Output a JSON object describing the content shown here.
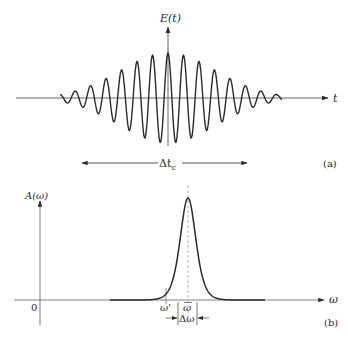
{
  "figure": {
    "panel_a": {
      "tag": "(a)",
      "y_label": "E(t)",
      "x_label": "t",
      "width_label_main": "Δt",
      "width_label_sub": "c"
    },
    "panel_b": {
      "tag": "(b)",
      "y_label": "A(ω)",
      "x_label": "ω",
      "origin_label": "0",
      "omega_prime_label": "ω'",
      "omega_bar_label": "ω",
      "width_label": "Δω"
    }
  },
  "colors": {
    "ink": "#2a2a2a",
    "axis": "#555555",
    "background": "#ffffff"
  },
  "chart_data": [
    {
      "type": "line",
      "title": "(a) Wave packet in time domain",
      "xlabel": "t",
      "ylabel": "E(t)",
      "description": "Gaussian-enveloped carrier oscillation centered on t=0; ~11 major cycles visible",
      "envelope": "gaussian",
      "carrier_period_px": 15.5,
      "peak_amplitude_px": 45,
      "annotation": "Δt_c spans the pulse duration",
      "grid": false,
      "legend": false
    },
    {
      "type": "line",
      "title": "(b) Spectral amplitude",
      "xlabel": "ω",
      "ylabel": "A(ω)",
      "description": "Single narrow peak centered at ω̄ with width Δω; ω' marked on left flank",
      "center_label": "ω̄",
      "marker_label": "ω'",
      "width_label": "Δω",
      "origin": "0",
      "grid": false,
      "legend": false
    }
  ]
}
